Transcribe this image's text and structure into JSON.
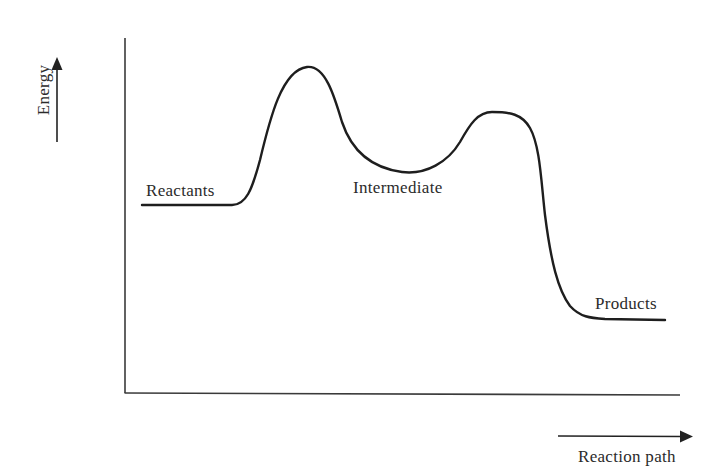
{
  "diagram": {
    "type": "reaction-energy-profile",
    "y_axis": {
      "label": "Energy",
      "arrow_direction": "up"
    },
    "x_axis": {
      "label": "Reaction path",
      "arrow_direction": "right"
    },
    "states": [
      {
        "id": "reactants",
        "label": "Reactants",
        "relative_energy": "medium"
      },
      {
        "id": "transition-state-1",
        "label": "",
        "relative_energy": "highest"
      },
      {
        "id": "intermediate",
        "label": "Intermediate",
        "relative_energy": "medium-high"
      },
      {
        "id": "transition-state-2",
        "label": "",
        "relative_energy": "high"
      },
      {
        "id": "products",
        "label": "Products",
        "relative_energy": "lowest"
      }
    ],
    "colors": {
      "line": "#1e1e1e",
      "axis": "#3a3a3a",
      "text": "#2b2b2b",
      "background": "#ffffff"
    }
  }
}
